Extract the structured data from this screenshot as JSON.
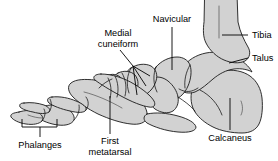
{
  "figure": {
    "kind": "anatomical-diagram",
    "background_color": "#ffffff",
    "bone_fill_color": "#d2d2d2",
    "bone_outline_color": "#1a1a1a",
    "label_color": "#000000",
    "width": 278,
    "height": 161
  },
  "labels": {
    "navicular": "Navicular",
    "tibia": "Tibia",
    "talus": "Talus",
    "calcaneus": "Calcaneus",
    "medial_cuneiform_line1": "Medial",
    "medial_cuneiform_line2": "cuneiform",
    "first_metatarsal_line1": "First",
    "first_metatarsal_line2": "metatarsal",
    "phalanges": "Phalanges"
  },
  "bones": [
    {
      "name": "tibia",
      "label": "Tibia"
    },
    {
      "name": "talus",
      "label": "Talus"
    },
    {
      "name": "calcaneus",
      "label": "Calcaneus"
    },
    {
      "name": "navicular",
      "label": "Navicular"
    },
    {
      "name": "medial-cuneiform",
      "label": "Medial cuneiform"
    },
    {
      "name": "first-metatarsal",
      "label": "First metatarsal"
    },
    {
      "name": "phalanges",
      "label": "Phalanges"
    }
  ]
}
